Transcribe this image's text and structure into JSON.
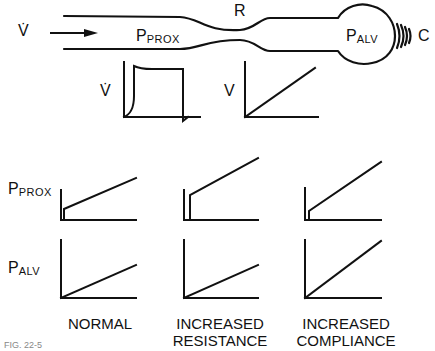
{
  "diagram": {
    "airway": {
      "flow_symbol": "V̇",
      "proximal_pressure": {
        "base": "P",
        "sub": "PROX"
      },
      "resistance_label": "R",
      "alveolar_pressure": {
        "base": "P",
        "sub": "ALV"
      },
      "compliance_label": "C"
    },
    "input_waveforms": {
      "flow_label": "V̇",
      "volume_label": "V"
    },
    "row_labels": {
      "prox": {
        "base": "P",
        "sub": "PROX"
      },
      "alv": {
        "base": "P",
        "sub": "ALV"
      }
    },
    "columns": [
      {
        "line1": "NORMAL",
        "line2": ""
      },
      {
        "line1": "INCREASED",
        "line2": "RESISTANCE"
      },
      {
        "line1": "INCREASED",
        "line2": "COMPLIANCE"
      }
    ],
    "caption_fragment": "FIG. 22-5"
  }
}
